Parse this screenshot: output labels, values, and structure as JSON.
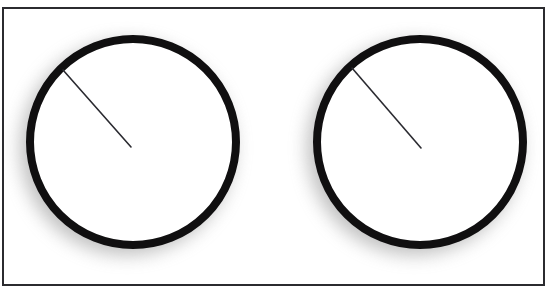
{
  "scene": {
    "title": "Two analog dials with pointer hands",
    "background_color": "#ffffff",
    "width": 557,
    "height": 296
  },
  "frame": {
    "name": "outer-frame",
    "border_color": "#2b2b2f",
    "border_width": 2,
    "x": 2,
    "y": 7,
    "width": 543,
    "height": 279,
    "fill": "#ffffff"
  },
  "dials": [
    {
      "label": "left-dial",
      "center_x": 133,
      "center_y": 142,
      "radius": 107,
      "ring_color": "#100f10",
      "ring_width": 8,
      "face_color": "#ffffff",
      "shadow_color": "#8c8c8c",
      "hand": {
        "label": "left-dial-hand",
        "color": "#2a2a30",
        "width": 1.6,
        "from_x": 63,
        "from_y": 70,
        "to_x": 131,
        "to_y": 147,
        "angle_degrees": 311,
        "length": 103
      }
    },
    {
      "label": "right-dial",
      "center_x": 420,
      "center_y": 142,
      "radius": 107,
      "ring_color": "#100f10",
      "ring_width": 8,
      "face_color": "#ffffff",
      "shadow_color": "#8c8c8c",
      "hand": {
        "label": "right-dial-hand",
        "color": "#2a2a30",
        "width": 1.6,
        "from_x": 352,
        "from_y": 68,
        "to_x": 421,
        "to_y": 148,
        "angle_degrees": 311,
        "length": 106
      }
    }
  ]
}
